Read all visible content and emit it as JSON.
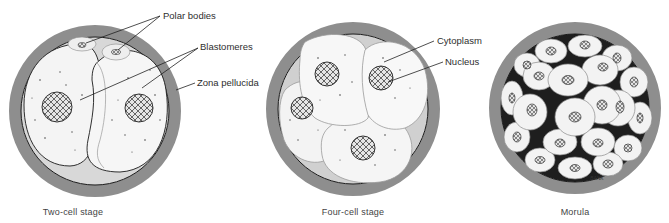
{
  "figure": {
    "stages": [
      {
        "id": "two-cell",
        "caption": "Two-cell stage",
        "cx": 95,
        "cy": 111,
        "r": 86,
        "caption_x": 73
      },
      {
        "id": "four-cell",
        "caption": "Four-cell stage",
        "cx": 353,
        "cy": 109,
        "r": 87,
        "caption_x": 353
      },
      {
        "id": "morula",
        "caption": "Morula",
        "cx": 575,
        "cy": 108,
        "r": 86,
        "caption_x": 575
      }
    ],
    "labels": {
      "polar_bodies": "Polar bodies",
      "blastomeres": "Blastomeres",
      "zona_pellucida": "Zona pellucida",
      "cytoplasm": "Cytoplasm",
      "nucleus": "Nucleus"
    },
    "signature": "BANK",
    "colors": {
      "zona": "#8e8e8e",
      "cell_fill": "#f4f4f4",
      "cell_line": "#9a9a9a",
      "outline": "#1a1a1a",
      "nucleus_fill": "#d9d9d9",
      "nucleus_line": "#3a3a3a",
      "shadow": "#c9c9c9"
    }
  }
}
